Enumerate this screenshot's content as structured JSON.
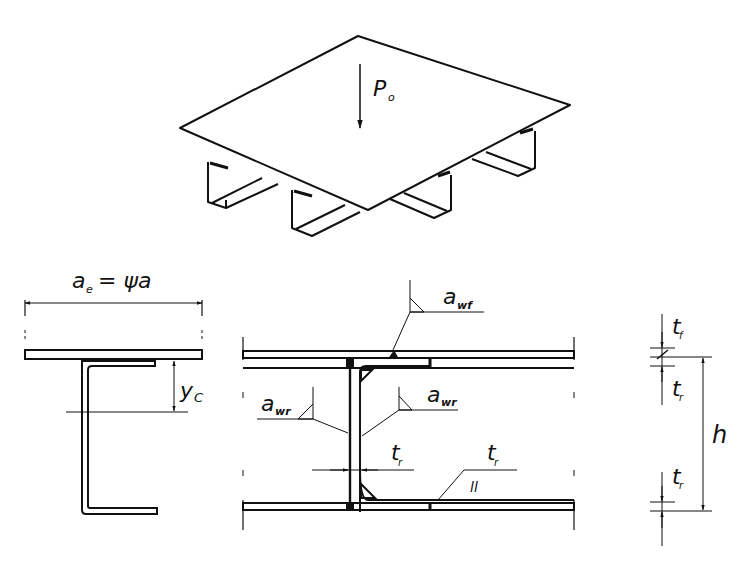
{
  "figure": {
    "isometric_view": {
      "load_label": "P",
      "load_label_sub": "o"
    },
    "left_section": {
      "effective_width_label": "a",
      "effective_width_sub": "e",
      "effective_width_eq": "= ψa",
      "centroid_label": "y",
      "centroid_sub": "C"
    },
    "middle_section": {
      "weld_top_label": "a",
      "weld_top_sub": "wf",
      "weld_left_label": "a",
      "weld_left_sub": "wr",
      "weld_right_label": "a",
      "weld_right_sub": "wr",
      "thickness_web_label": "t",
      "thickness_web_sub": "r",
      "thickness_bottom_label": "t",
      "thickness_bottom_sub": "r",
      "parallel_symbol": "ll"
    },
    "right_dimensions": {
      "top_flange_label": "t",
      "top_flange_sub": "f",
      "top_rib_label": "t",
      "top_rib_sub": "r",
      "height_label": "h",
      "bottom_rib_label": "t",
      "bottom_rib_sub": "r"
    }
  }
}
